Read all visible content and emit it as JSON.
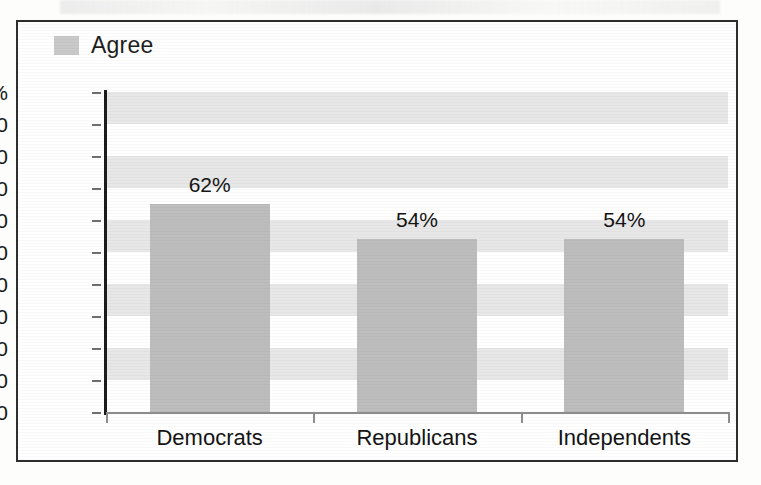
{
  "chart_data": {
    "type": "bar",
    "title": "",
    "subtitle": "",
    "xlabel": "",
    "ylabel": "",
    "categories": [
      "Democrats",
      "Republicans",
      "Independents"
    ],
    "values": [
      62,
      54,
      54
    ],
    "bar_pixel_values": [
      65,
      54,
      54
    ],
    "data_labels": [
      "62%",
      "54%",
      "54%"
    ],
    "series": [
      {
        "name": "Agree",
        "values": [
          62,
          54,
          54
        ],
        "color": "#bdbdbd"
      }
    ],
    "ylim": [
      0,
      100
    ],
    "y_ticks": [
      0,
      10,
      20,
      30,
      40,
      50,
      60,
      70,
      80,
      90,
      100
    ],
    "y_tick_labels": [
      "0",
      "10",
      "20",
      "30",
      "40",
      "50",
      "60",
      "70",
      "80",
      "90",
      "100%"
    ],
    "grid": false,
    "banded_background": true,
    "band_color": "#e7e7e7",
    "legend_position": "top-left",
    "legend": [
      "Agree"
    ]
  },
  "legend": {
    "swatch_name": "agree-swatch",
    "label": "Agree",
    "color": "#c9c9c9"
  },
  "axes": {
    "y_tick_labels": [
      "100%",
      "90",
      "80",
      "70",
      "60",
      "50",
      "40",
      "30",
      "20",
      "10",
      "0"
    ],
    "y_tick_values": [
      100,
      90,
      80,
      70,
      60,
      50,
      40,
      30,
      20,
      10,
      0
    ],
    "axis_color": "#1c1c1c",
    "baseline_color": "#8d8d8d"
  },
  "bars": [
    {
      "name": "bar-democrats",
      "category": "Democrats",
      "value": 62,
      "plot_height": 65,
      "label": "62%",
      "color": "#bdbdbd"
    },
    {
      "name": "bar-republicans",
      "category": "Republicans",
      "value": 54,
      "plot_height": 54,
      "label": "54%",
      "color": "#bdbdbd"
    },
    {
      "name": "bar-independents",
      "category": "Independents",
      "value": 54,
      "plot_height": 54,
      "label": "54%",
      "color": "#bdbdbd"
    }
  ],
  "frame": {
    "border_color": "#2e2e2e",
    "background": "#ffffff"
  }
}
